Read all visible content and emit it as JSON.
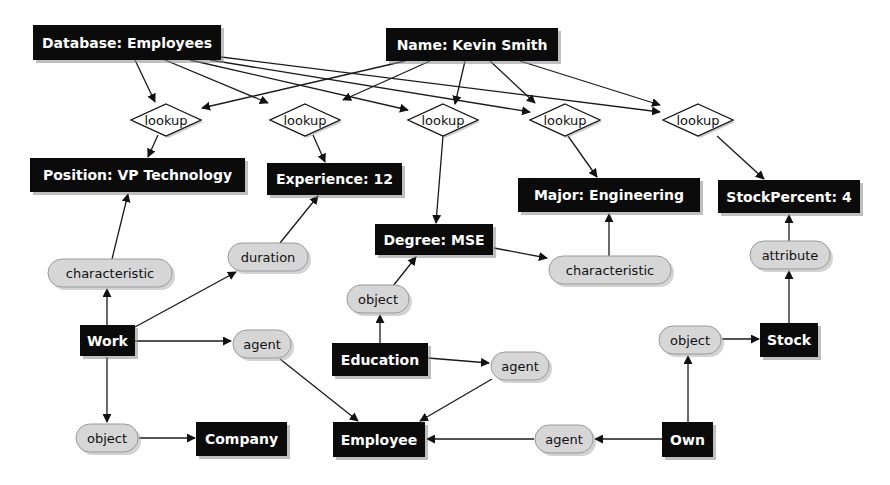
{
  "diagram": {
    "colors": {
      "concept_fill": "#0b0b0b",
      "concept_text": "#ffffff",
      "relation_fill": "#d6d6d6",
      "relation_text": "#111111",
      "actor_fill": "#ffffff",
      "edge": "#1a1a1a",
      "background": "#ffffff"
    },
    "nodes": [
      {
        "id": "db",
        "type": "rect",
        "label": "Database: Employees",
        "x": 33,
        "y": 25,
        "w": 188,
        "h": 35
      },
      {
        "id": "name",
        "type": "rect",
        "label": "Name: Kevin Smith",
        "x": 386,
        "y": 28,
        "w": 172,
        "h": 33
      },
      {
        "id": "lk1",
        "type": "diamond",
        "label": "lookup",
        "cx": 166,
        "cy": 120,
        "w": 70,
        "h": 32
      },
      {
        "id": "lk2",
        "type": "diamond",
        "label": "lookup",
        "cx": 305,
        "cy": 120,
        "w": 70,
        "h": 32
      },
      {
        "id": "lk3",
        "type": "diamond",
        "label": "lookup",
        "cx": 443,
        "cy": 120,
        "w": 70,
        "h": 32
      },
      {
        "id": "lk4",
        "type": "diamond",
        "label": "lookup",
        "cx": 565,
        "cy": 120,
        "w": 70,
        "h": 32
      },
      {
        "id": "lk5",
        "type": "diamond",
        "label": "lookup",
        "cx": 698,
        "cy": 120,
        "w": 70,
        "h": 32
      },
      {
        "id": "position",
        "type": "rect",
        "label": "Position: VP Technology",
        "x": 30,
        "y": 158,
        "w": 215,
        "h": 34
      },
      {
        "id": "exp",
        "type": "rect",
        "label": "Experience: 12",
        "x": 267,
        "y": 163,
        "w": 135,
        "h": 32
      },
      {
        "id": "major",
        "type": "rect",
        "label": "Major: Engineering",
        "x": 518,
        "y": 178,
        "w": 182,
        "h": 34
      },
      {
        "id": "stockpct",
        "type": "rect",
        "label": "StockPercent: 4",
        "x": 718,
        "y": 180,
        "w": 142,
        "h": 33
      },
      {
        "id": "degree",
        "type": "rect",
        "label": "Degree: MSE",
        "x": 375,
        "y": 224,
        "w": 118,
        "h": 31
      },
      {
        "id": "char1",
        "type": "oval",
        "label": "characteristic",
        "cx": 110,
        "cy": 273,
        "w": 124,
        "h": 28
      },
      {
        "id": "duration",
        "type": "oval",
        "label": "duration",
        "cx": 268,
        "cy": 257,
        "w": 80,
        "h": 28
      },
      {
        "id": "char2",
        "type": "oval",
        "label": "characteristic",
        "cx": 610,
        "cy": 270,
        "w": 122,
        "h": 28
      },
      {
        "id": "attribute",
        "type": "oval",
        "label": "attribute",
        "cx": 790,
        "cy": 255,
        "w": 80,
        "h": 28
      },
      {
        "id": "obj_edu",
        "type": "oval",
        "label": "object",
        "cx": 378,
        "cy": 299,
        "w": 62,
        "h": 28
      },
      {
        "id": "work",
        "type": "rect",
        "label": "Work",
        "x": 80,
        "y": 325,
        "w": 55,
        "h": 31
      },
      {
        "id": "agent_w",
        "type": "oval",
        "label": "agent",
        "cx": 262,
        "cy": 344,
        "w": 58,
        "h": 28
      },
      {
        "id": "education",
        "type": "rect",
        "label": "Education",
        "x": 332,
        "y": 343,
        "w": 96,
        "h": 33
      },
      {
        "id": "agent_e",
        "type": "oval",
        "label": "agent",
        "cx": 520,
        "cy": 366,
        "w": 58,
        "h": 28
      },
      {
        "id": "obj_own",
        "type": "oval",
        "label": "object",
        "cx": 690,
        "cy": 340,
        "w": 62,
        "h": 28
      },
      {
        "id": "stock",
        "type": "rect",
        "label": "Stock",
        "x": 760,
        "y": 323,
        "w": 58,
        "h": 34
      },
      {
        "id": "obj_work",
        "type": "oval",
        "label": "object",
        "cx": 107,
        "cy": 438,
        "w": 62,
        "h": 28
      },
      {
        "id": "company",
        "type": "rect",
        "label": "Company",
        "x": 196,
        "y": 422,
        "w": 91,
        "h": 34
      },
      {
        "id": "employee",
        "type": "rect",
        "label": "Employee",
        "x": 333,
        "y": 422,
        "w": 92,
        "h": 35
      },
      {
        "id": "agent_o",
        "type": "oval",
        "label": "agent",
        "cx": 564,
        "cy": 439,
        "w": 58,
        "h": 28
      },
      {
        "id": "own",
        "type": "rect",
        "label": "Own",
        "x": 662,
        "y": 422,
        "w": 51,
        "h": 35
      }
    ],
    "edges": [
      {
        "from": "db",
        "to": "lk1",
        "x1": 135,
        "y1": 60,
        "x2": 155,
        "y2": 102
      },
      {
        "from": "db",
        "to": "lk2",
        "x1": 165,
        "y1": 60,
        "x2": 268,
        "y2": 103
      },
      {
        "from": "db",
        "to": "lk3",
        "x1": 190,
        "y1": 60,
        "x2": 408,
        "y2": 110
      },
      {
        "from": "db",
        "to": "lk4",
        "x1": 210,
        "y1": 60,
        "x2": 530,
        "y2": 112
      },
      {
        "from": "db",
        "to": "lk5",
        "x1": 221,
        "y1": 57,
        "x2": 660,
        "y2": 112
      },
      {
        "from": "name",
        "to": "lk1",
        "x1": 405,
        "y1": 61,
        "x2": 202,
        "y2": 108
      },
      {
        "from": "name",
        "to": "lk2",
        "x1": 430,
        "y1": 61,
        "x2": 343,
        "y2": 100
      },
      {
        "from": "name",
        "to": "lk3",
        "x1": 465,
        "y1": 61,
        "x2": 455,
        "y2": 104
      },
      {
        "from": "name",
        "to": "lk4",
        "x1": 490,
        "y1": 61,
        "x2": 535,
        "y2": 103
      },
      {
        "from": "name",
        "to": "lk5",
        "x1": 520,
        "y1": 61,
        "x2": 660,
        "y2": 105
      },
      {
        "from": "lk1",
        "to": "position",
        "x1": 158,
        "y1": 135,
        "x2": 148,
        "y2": 157
      },
      {
        "from": "lk2",
        "to": "exp",
        "x1": 313,
        "y1": 135,
        "x2": 325,
        "y2": 162
      },
      {
        "from": "lk3",
        "to": "degree",
        "x1": 443,
        "y1": 136,
        "x2": 436,
        "y2": 223
      },
      {
        "from": "lk4",
        "to": "major",
        "x1": 568,
        "y1": 136,
        "x2": 597,
        "y2": 177
      },
      {
        "from": "lk5",
        "to": "stockpct",
        "x1": 717,
        "y1": 136,
        "x2": 764,
        "y2": 179
      },
      {
        "from": "char1",
        "to": "position",
        "x1": 112,
        "y1": 259,
        "x2": 128,
        "y2": 194
      },
      {
        "from": "duration",
        "to": "exp",
        "x1": 280,
        "y1": 243,
        "x2": 318,
        "y2": 196
      },
      {
        "from": "char2",
        "to": "major",
        "x1": 609,
        "y1": 256,
        "x2": 609,
        "y2": 214
      },
      {
        "from": "attribute",
        "to": "stockpct",
        "x1": 789,
        "y1": 241,
        "x2": 789,
        "y2": 215
      },
      {
        "from": "degree",
        "to": "char2",
        "x1": 494,
        "y1": 248,
        "x2": 547,
        "y2": 258
      },
      {
        "from": "obj_edu",
        "to": "degree",
        "x1": 393,
        "y1": 286,
        "x2": 416,
        "y2": 257
      },
      {
        "from": "work",
        "to": "char1",
        "x1": 107,
        "y1": 325,
        "x2": 107,
        "y2": 289
      },
      {
        "from": "work",
        "to": "duration",
        "x1": 135,
        "y1": 327,
        "x2": 236,
        "y2": 272
      },
      {
        "from": "work",
        "to": "agent_w",
        "x1": 135,
        "y1": 341,
        "x2": 231,
        "y2": 341
      },
      {
        "from": "work",
        "to": "obj_work",
        "x1": 107,
        "y1": 357,
        "x2": 107,
        "y2": 422
      },
      {
        "from": "agent_w",
        "to": "employee",
        "x1": 280,
        "y1": 359,
        "x2": 358,
        "y2": 421
      },
      {
        "from": "education",
        "to": "obj_edu",
        "x1": 380,
        "y1": 343,
        "x2": 380,
        "y2": 315
      },
      {
        "from": "education",
        "to": "agent_e",
        "x1": 428,
        "y1": 358,
        "x2": 489,
        "y2": 363
      },
      {
        "from": "agent_e",
        "to": "employee",
        "x1": 492,
        "y1": 379,
        "x2": 420,
        "y2": 421
      },
      {
        "from": "obj_work",
        "to": "company",
        "x1": 139,
        "y1": 438,
        "x2": 195,
        "y2": 438
      },
      {
        "from": "own",
        "to": "agent_o",
        "x1": 662,
        "y1": 439,
        "x2": 595,
        "y2": 439
      },
      {
        "from": "agent_o",
        "to": "employee",
        "x1": 534,
        "y1": 439,
        "x2": 427,
        "y2": 439
      },
      {
        "from": "own",
        "to": "obj_own",
        "x1": 688,
        "y1": 422,
        "x2": 688,
        "y2": 356
      },
      {
        "from": "obj_own",
        "to": "stock",
        "x1": 722,
        "y1": 339,
        "x2": 759,
        "y2": 339
      },
      {
        "from": "stock",
        "to": "attribute",
        "x1": 789,
        "y1": 323,
        "x2": 789,
        "y2": 271
      }
    ]
  }
}
